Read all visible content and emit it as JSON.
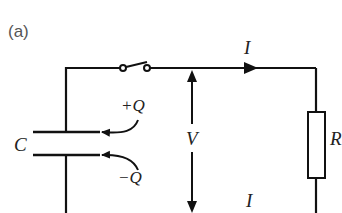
{
  "figure": {
    "panel_label": "(a)",
    "labels": {
      "current_top": "I",
      "current_bottom": "I",
      "voltage": "V",
      "resistance": "R",
      "capacitance": "C",
      "charge_positive": "+Q",
      "charge_negative": "−Q"
    },
    "components": [
      {
        "type": "capacitor",
        "label": "C"
      },
      {
        "type": "switch",
        "state": "open"
      },
      {
        "type": "resistor",
        "label": "R"
      },
      {
        "type": "voltage-arrow",
        "label": "V"
      },
      {
        "type": "current-arrow",
        "label": "I",
        "direction": "right"
      }
    ],
    "colors": {
      "line": "#111111",
      "label_text": "#555555"
    }
  }
}
